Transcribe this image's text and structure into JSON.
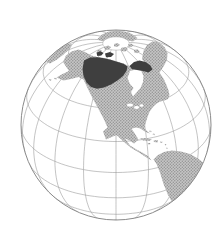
{
  "colors": {
    "background": "#ffffff",
    "ocean": "#ffffff",
    "rim": "#8a8a8a",
    "graticule": "#9c9c9c",
    "land_base": "#c6c6c6",
    "land_dot": "#8e8e8e",
    "highlight": "#3f3f3f",
    "cap_stroke": "#b3b3b3"
  },
  "projection": {
    "cx": 116,
    "cy": 125,
    "r": 95,
    "center_lat": 30,
    "center_lon": -100,
    "parallels": [
      -60,
      -40,
      -20,
      0,
      20,
      40,
      60
    ],
    "meridian_step": 20,
    "cap_lat": 82,
    "graticule_width": 0.6,
    "rim_width": 1
  },
  "map": {
    "shapes": [
      {
        "name": "northeast-asia",
        "layer": "land",
        "d": "M66.5,43.5 L72,44.5 L69,49.5 L63.5,54.5 L57,59.5 L50,63.5 L46.5,62 L50.5,57 L56.5,51 L61.5,46.5 Z"
      },
      {
        "name": "arctic-far-side-land",
        "layer": "land",
        "d": "M97,39.5 L102,34.5 L109,31.5 L117,30.8 L125,31.5 L132,34 L137.5,38 L133,41.5 L126,40 L118,39.5 L110,40 L103,41.5 Z"
      },
      {
        "name": "north-america",
        "layer": "land",
        "d": "M63,62 L66,55.5 L71.5,51.5 L78.5,49.5 L85,52 L91.5,55.5 L97.5,57 L104,58 L110.5,59.5 L117,61.5 L123.5,63.5 L129,66 L134,68.5 L138,70 L142.5,67.5 L147.5,65.5 L152.5,66.5 L157,70 L160.5,74 L164,79.5 L166.5,85 L168.5,90.5 L169.5,95 L168,99 L164.5,100.5 L160,101.5 L156,104 L152.5,107.5 L149.5,112 L147.5,117 L146,122 L145,126 L144.5,128.5 L147,131 L150,133.5 L145.5,132 L140.5,128.5 L136,127.5 L131.5,128.8 L134.5,133 L138.5,139.5 L134,143.5 L129.5,140.5 L125,138.5 L130,145.5 L136.5,149.5 L143,153 L148.5,156.5 L151.5,160.5 L146.5,157.5 L139,152.5 L130.5,147.5 L123.5,141.5 L116.5,135 L110.5,137.5 L106,139.5 L103,131.5 L107.5,127.5 L104,119.5 L98.5,109 L92.5,98 L87.5,88 L83.5,79.5 L78.5,77 L71,79 L63.5,80.5 L56.5,77.5 L62.5,74 L69,71 L66,66.5 Z"
      },
      {
        "name": "greenland",
        "layer": "land",
        "d": "M142,59 L143.5,51 L147,45 L152.5,41.5 L159,42.5 L164.5,47 L167.5,53 L167,60 L163.5,66.5 L159.5,72.5 L155.5,76 L151.5,71 L146.5,65 Z"
      },
      {
        "name": "south-america",
        "layer": "land",
        "d": "M153.5,159.5 L158,155 L164,152 L172,150.5 L181,151.5 L190,154 L198,158.5 L205,164 L210,172 L211,183 L207,196 L199,206 L189,212 L180,211 L173.5,204.5 L168,195 L163.5,184 L160,172.5 L156.5,164 Z"
      },
      {
        "name": "hudson-bay",
        "layer": "overlay",
        "d": "M130,71 L136,69.5 L141,70.5 L143.5,76 L143,82 L140.5,88 L136.5,92.5 L133,96.5 L131,92 L133.5,88 L130,84 L127.5,78 Z"
      },
      {
        "name": "great-lakes",
        "layer": "overlay",
        "d": "M127,105 a3,1.6 0 1 0 6,0 a3,1.6 0 1 0 -6,0 M134,107.5 a2.6,1.4 0 1 0 5.2,0 a2.6,1.4 0 1 0 -5.2,0 M139.5,105.5 a2,1.2 0 1 0 4,0 a2,1.2 0 1 0 -4,0"
      },
      {
        "name": "arctic-island-1",
        "layer": "island",
        "d": "M104,47 l4,-1.5 l3,1.5 l-2,2.5 l-4,0.5 Z"
      },
      {
        "name": "arctic-island-2",
        "layer": "island",
        "d": "M114,44 l3.5,-1 l2.5,2 l-3,2 l-3,-0.8 Z"
      },
      {
        "name": "arctic-island-3",
        "layer": "island",
        "d": "M121,48 l4,-1 l3,2 l-2.5,2.6 l-4.5,-0.6 Z"
      },
      {
        "name": "arctic-island-4",
        "layer": "island",
        "d": "M128,44.5 l3,-1 l2.6,1.6 l-2,2 l-3.4,-0.4 Z"
      },
      {
        "name": "arctic-island-5",
        "layer": "island",
        "d": "M134,50 l3.4,-0.8 l2.4,2 l-2.6,2 l-3.2,-1 Z"
      },
      {
        "name": "arctic-island-6",
        "layer": "island",
        "d": "M97,50.5 l3,-1 l2,1.5 l-2,1.8 l-2.6,-0.5 Z"
      },
      {
        "name": "southampton-island",
        "layer": "island",
        "d": "M138,64 l3.5,-1 l2,2 l-2.5,2 l-3,-0.8 Z"
      },
      {
        "name": "aleutian-islands",
        "layer": "island",
        "d": "M49,79 l2.5,0.5 l-0.5,1.2 l-2.2,-0.6 Z M54.5,77.8 l2.5,0.5 l-0.5,1.2 l-2.2,-0.6 Z"
      },
      {
        "name": "cuba",
        "layer": "island",
        "d": "M139.5,138.5 L146,138 L152,139.5 L149,141 L143,140.5 Z"
      },
      {
        "name": "hispaniola",
        "layer": "island",
        "d": "M153.5,140.5 L158,140 L157.5,142.5 L154,142 Z"
      },
      {
        "name": "jamaica",
        "layer": "island",
        "d": "M147.5,143 L150.5,143 L150,144.5 L148,144.3 Z"
      },
      {
        "name": "puerto-rico",
        "layer": "island",
        "d": "M160,141.5 L162.5,141.7 L162,143 L160.3,142.8 Z"
      },
      {
        "name": "lesser-antilles",
        "layer": "island",
        "d": "M165,144 l1.5,0.5 l-0.8,1 l-1,-0.6 Z M166.5,147.5 l1.4,0.6 l-0.8,1 l-1,-0.7 Z M167,150.8 l1.4,0.6 l-0.8,1 l-1,-0.6 Z"
      },
      {
        "name": "bahamas",
        "layer": "island",
        "d": "M149.5,130.5 l2.2,0.6 l-0.6,1.2 l-1.8,-0.8 Z M153,133.5 l2,0.6 l-0.6,1.1 l-1.7,-0.7 Z"
      },
      {
        "name": "highlight-region-mainland",
        "layer": "highlight",
        "d": "M84,60.5 L90,57.5 L97.5,57.2 L104,58.2 L110.5,59.7 L117,61.7 L123.5,63.7 L127.5,66.5 L126.5,71 L123,76 L117.5,80.5 L111,84.5 L104,87.5 L97,88.8 L91,87 L86.5,82.5 L83.5,76 L82.5,69 Z"
      },
      {
        "name": "highlight-region-northeast",
        "layer": "highlight",
        "d": "M129.5,66 L134,62 L139.5,60.5 L145.5,62 L150.5,65.5 L152.5,69.5 L148.5,72.5 L143,71 L137,70 L132,69 Z"
      },
      {
        "name": "highlight-island-west",
        "layer": "highlight",
        "d": "M96.5,52.5 l4,-1.2 l3,1.8 l-2.2,2.4 l-4,0.4 Z"
      },
      {
        "name": "highlight-island-east",
        "layer": "highlight",
        "d": "M105,53.5 l5,-1.4 l4,2 l-3,2.8 l-5,0.4 Z"
      }
    ]
  }
}
